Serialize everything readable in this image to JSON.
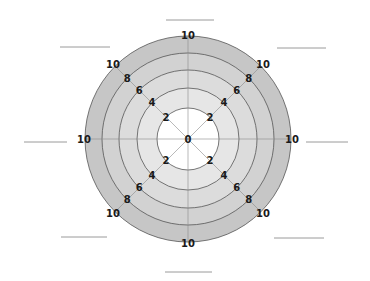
{
  "chart_data": {
    "type": "radar",
    "title": "",
    "axes_count": 8,
    "axis_labels": [
      "",
      "",
      "",
      "",
      "",
      "",
      "",
      ""
    ],
    "axis_label_style": "blank-underline-placeholders",
    "scale_ticks": [
      "0",
      "2",
      "4",
      "6",
      "8",
      "10"
    ],
    "range": [
      0,
      10
    ],
    "series": [],
    "center_label": "0",
    "ring_fill_colors": {
      "r2": "#ffffff",
      "r4": "#e6e6e6",
      "r6": "#dcdcdc",
      "r8": "#d2d2d2",
      "r10": "#c6c6c6"
    },
    "ring_stroke_color": "#555555",
    "axis_line_color": "#8a8a8a"
  },
  "layout": {
    "cx": 188,
    "cy": 139,
    "radii": {
      "2": 31,
      "4": 51,
      "6": 69,
      "8": 86,
      "10": 103
    }
  }
}
